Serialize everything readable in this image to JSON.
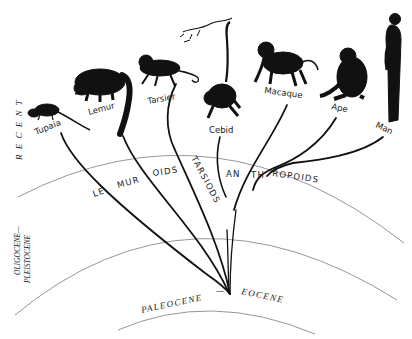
{
  "diagram": {
    "type": "phylogenetic-tree",
    "eras": [
      {
        "id": "recent",
        "label": "R E C E N T"
      },
      {
        "id": "oligocene-pleistocene",
        "label_line1": "OLIGOCENE—",
        "label_line2": "PLEISTOCENE"
      },
      {
        "id": "paleocene-eocene",
        "label_left": "PALEOCENE",
        "dash": "—",
        "label_right": "EOCENE"
      }
    ],
    "animals": [
      {
        "id": "tupaia",
        "label": "Tupaia"
      },
      {
        "id": "lemur",
        "label": "Lemur"
      },
      {
        "id": "tarsier",
        "label": "Tarsier"
      },
      {
        "id": "cebid",
        "label": "Cebid"
      },
      {
        "id": "macaque",
        "label": "Macaque"
      },
      {
        "id": "ape",
        "label": "Ape"
      },
      {
        "id": "man",
        "label": "Man"
      }
    ],
    "groups": [
      {
        "id": "lemuroids",
        "parts": [
          "LE",
          "MUR",
          "OIDS"
        ]
      },
      {
        "id": "tarsiods",
        "label": "TARSIODS"
      },
      {
        "id": "anthropoids",
        "parts": [
          "AN",
          "TH",
          "ROPOIDS"
        ]
      }
    ],
    "colors": {
      "ink": "#111111",
      "arc": "#8a8a8a",
      "background": "#ffffff"
    }
  }
}
